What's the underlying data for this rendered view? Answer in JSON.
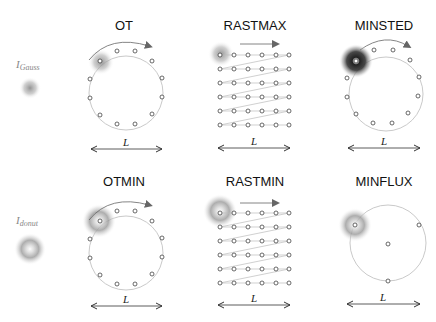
{
  "diagram": {
    "rows": [
      {
        "beam_label": {
          "main": "I",
          "sub": "Gauss"
        },
        "beam_type": "gaussian",
        "panels": [
          {
            "title": "OT",
            "pattern": "circle",
            "points": 12,
            "scale_label": "L"
          },
          {
            "title": "RASTMAX",
            "pattern": "raster",
            "grid": "6x6",
            "scale_label": "L"
          },
          {
            "title": "MINSTED",
            "pattern": "circle",
            "points": 12,
            "scale_label": "L"
          }
        ]
      },
      {
        "beam_label": {
          "main": "I",
          "sub": "donut"
        },
        "beam_type": "donut",
        "panels": [
          {
            "title": "OTMIN",
            "pattern": "circle",
            "points": 12,
            "scale_label": "L"
          },
          {
            "title": "RASTMIN",
            "pattern": "raster",
            "grid": "6x6",
            "scale_label": "L"
          },
          {
            "title": "MINFLUX",
            "pattern": "triangle+center",
            "points": 4,
            "scale_label": "L"
          }
        ]
      }
    ],
    "colors": {
      "point_stroke": "#444444",
      "path": "#aaaaaa",
      "arrow": "#666666",
      "beam": "#888888"
    }
  }
}
